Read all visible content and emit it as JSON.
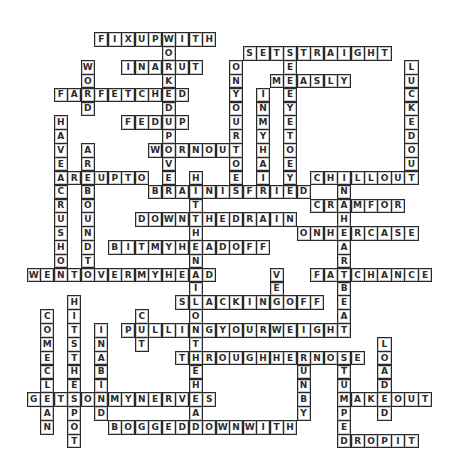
{
  "puzzle": {
    "type": "crossword-solution",
    "grid": {
      "origin_x": 26.7,
      "origin_y": 32.3,
      "col_pitch": 13.49,
      "row_pitch": 13.85
    },
    "colors": {
      "background": "#ffffff",
      "cell_fill": "#ffffff",
      "cell_border": "#2a2a2a",
      "letter": "#2b2b2b"
    },
    "across": [
      {
        "word": "FIXUPWITH",
        "row": 0,
        "col": 5
      },
      {
        "word": "SETSTRAIGHT",
        "row": 1,
        "col": 16
      },
      {
        "word": "INARUT",
        "row": 2,
        "col": 7
      },
      {
        "word": "MEASLY",
        "row": 3,
        "col": 18
      },
      {
        "word": "FARFETCHED",
        "row": 4,
        "col": 2
      },
      {
        "word": "FEDUP",
        "row": 6,
        "col": 7
      },
      {
        "word": "WORNOUT",
        "row": 8,
        "col": 9
      },
      {
        "word": "AREUPTO",
        "row": 10,
        "col": 2
      },
      {
        "word": "CHILLOUT",
        "row": 10,
        "col": 21
      },
      {
        "word": "BRAINISFRIED",
        "row": 11,
        "col": 9
      },
      {
        "word": "CRAMFOR",
        "row": 12,
        "col": 21
      },
      {
        "word": "DOWNTHEDRAIN",
        "row": 13,
        "col": 8
      },
      {
        "word": "ONHERCASE",
        "row": 14,
        "col": 20
      },
      {
        "word": "BITMYHEADOFF",
        "row": 15,
        "col": 6
      },
      {
        "word": "WENTOVERMYHEAD",
        "row": 17,
        "col": 0
      },
      {
        "word": "FATCHANCE",
        "row": 17,
        "col": 21
      },
      {
        "word": "SLACKINGOFF",
        "row": 19,
        "col": 11
      },
      {
        "word": "PULLINGYOURWEIGHT",
        "row": 21,
        "col": 7
      },
      {
        "word": "THROUGHHERNOSE",
        "row": 23,
        "col": 11
      },
      {
        "word": "GETSONMYNERVES",
        "row": 26,
        "col": 0
      },
      {
        "word": "MAKEOUT",
        "row": 26,
        "col": 23
      },
      {
        "word": "BOGGEDDOWNWITH",
        "row": 28,
        "col": 6
      },
      {
        "word": "DROPIT",
        "row": 29,
        "col": 23
      }
    ],
    "down": [
      {
        "word": "WORKEDUPOVER",
        "row": 0,
        "col": 10
      },
      {
        "word": "SEEEYETOEYE",
        "row": 1,
        "col": 19
      },
      {
        "word": "WORD",
        "row": 2,
        "col": 4
      },
      {
        "word": "ONYOURTOES",
        "row": 2,
        "col": 15
      },
      {
        "word": "LUCKEDOUT",
        "row": 2,
        "col": 28
      },
      {
        "word": "INMYHAIR",
        "row": 4,
        "col": 17
      },
      {
        "word": "HAVEACRUSHON",
        "row": 6,
        "col": 2
      },
      {
        "word": "AREBOUNDTO",
        "row": 8,
        "col": 4
      },
      {
        "word": "HITTHENAILONTHEHEAD",
        "row": 10,
        "col": 12
      },
      {
        "word": "INAHEARTBEAT",
        "row": 10,
        "col": 23
      },
      {
        "word": "VEG",
        "row": 17,
        "col": 18
      },
      {
        "word": "HITSTHESPOT",
        "row": 19,
        "col": 3
      },
      {
        "word": "COMECLEAN",
        "row": 20,
        "col": 1
      },
      {
        "word": "CUT",
        "row": 20,
        "col": 8
      },
      {
        "word": "INABIND",
        "row": 21,
        "col": 5
      },
      {
        "word": "LOADED",
        "row": 22,
        "col": 26
      },
      {
        "word": "RUNBY",
        "row": 23,
        "col": 20
      },
      {
        "word": "STUMPED",
        "row": 23,
        "col": 23
      }
    ]
  }
}
